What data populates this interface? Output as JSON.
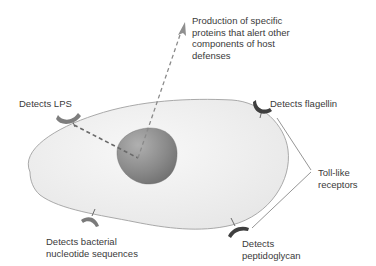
{
  "diagram": {
    "type": "cell-toll-like-receptors",
    "labels": {
      "production": "Production of specific\nproteins that alert other\ncomponents of host\ndefenses",
      "lps": "Detects LPS",
      "flagellin": "Detects flagellin",
      "tlr": "Toll-like\nreceptors",
      "nucleotide": "Detects bacterial\nnucleotide sequences",
      "peptidoglycan": "Detects\npeptidoglycan"
    },
    "colors": {
      "cell_fill": "#efefef",
      "cell_stroke": "#9a9a9a",
      "nucleus_fill": "#8a8a8a",
      "receptor_light": "#7a7a7a",
      "receptor_dark": "#3e3e3e",
      "dash_line": "#7a7a7a",
      "text": "#3a3a3a"
    },
    "components": [
      "cell membrane",
      "nucleus",
      "LPS receptor",
      "flagellin receptor",
      "nucleotide receptor",
      "peptidoglycan receptor",
      "signal pathway arrow"
    ]
  }
}
